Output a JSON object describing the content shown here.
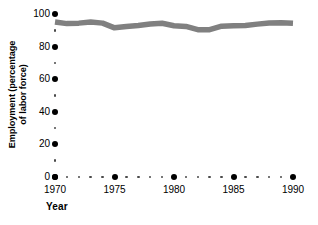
{
  "chart_data": {
    "type": "line",
    "title": "",
    "xlabel": "Year",
    "ylabel": "Employment (percentage\nof labor force)",
    "xlim": [
      1970,
      1990
    ],
    "ylim": [
      0,
      100
    ],
    "grid": false,
    "legend": null,
    "line_color": "#808080",
    "axis_color": "#000000",
    "x": [
      1970,
      1971,
      1972,
      1973,
      1974,
      1975,
      1976,
      1977,
      1978,
      1979,
      1980,
      1981,
      1982,
      1983,
      1984,
      1985,
      1986,
      1987,
      1988,
      1989,
      1990
    ],
    "values": [
      95.1,
      94.1,
      94.4,
      95.1,
      94.4,
      91.5,
      92.3,
      93.0,
      93.9,
      94.3,
      92.8,
      92.4,
      90.4,
      90.4,
      92.5,
      92.8,
      93.0,
      93.8,
      94.5,
      94.7,
      94.3
    ],
    "series": [
      {
        "name": "Employment",
        "values": [
          95.1,
          94.1,
          94.4,
          95.1,
          94.4,
          91.5,
          92.3,
          93.0,
          93.9,
          94.3,
          92.8,
          92.4,
          90.4,
          90.4,
          92.5,
          92.8,
          93.0,
          93.8,
          94.5,
          94.7,
          94.3
        ]
      }
    ],
    "y_major_ticks": [
      0,
      20,
      40,
      60,
      80,
      100
    ],
    "y_major_tick_labels": [
      "0",
      "20",
      "40",
      "60",
      "80",
      "100"
    ],
    "y_minor_ticks": [
      10,
      30,
      50,
      70,
      90
    ],
    "x_major_ticks": [
      1970,
      1975,
      1980,
      1985,
      1990
    ],
    "x_major_tick_labels": [
      "1970",
      "1975",
      "1980",
      "1985",
      "1990"
    ],
    "x_minor_ticks": [
      1971,
      1972,
      1973,
      1974,
      1976,
      1977,
      1978,
      1979,
      1981,
      1982,
      1983,
      1984,
      1986,
      1987,
      1988,
      1989
    ]
  }
}
